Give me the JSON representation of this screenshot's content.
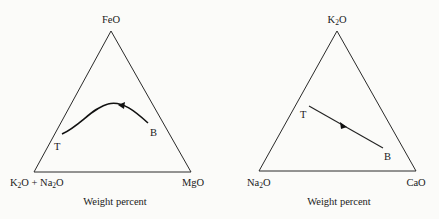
{
  "diagrams": [
    {
      "name": "left-ternary",
      "apex_label": "FeO",
      "bottom_left_label": {
        "a": "K",
        "a_sub": "2",
        "b": "O + Na",
        "b_sub": "2",
        "c": "O"
      },
      "bottom_right_label": "MgO",
      "caption": "Weight percent",
      "start_label": "T",
      "end_label": "B",
      "trend": "curved path from B toward T with arrow"
    },
    {
      "name": "right-ternary",
      "apex_label": {
        "a": "K",
        "a_sub": "2",
        "b": "O"
      },
      "bottom_left_label": {
        "a": "Na",
        "a_sub": "2",
        "b": "O"
      },
      "bottom_right_label": "CaO",
      "caption": "Weight percent",
      "start_label": "T",
      "end_label": "B",
      "trend": "straight path from B toward T with arrow"
    }
  ]
}
